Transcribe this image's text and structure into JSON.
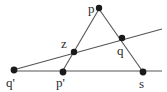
{
  "figure": {
    "width": 167,
    "height": 92,
    "background_color": "#ffffff",
    "stroke_color": "#555555",
    "point_color": "#1a1a1a",
    "label_color": "#2b2b2b"
  },
  "points": [
    {
      "id": "p",
      "label": "p",
      "x": 99,
      "y": 8,
      "label_x": 88,
      "label_y": 2,
      "radius": 3.2
    },
    {
      "id": "z",
      "label": "z",
      "x": 74,
      "y": 52,
      "label_x": 61,
      "label_y": 37,
      "radius": 3.2
    },
    {
      "id": "q",
      "label": "q",
      "x": 122,
      "y": 38,
      "label_x": 117,
      "label_y": 44,
      "radius": 3.2
    },
    {
      "id": "q-prime",
      "label": "q'",
      "x": 14,
      "y": 70,
      "label_x": 6,
      "label_y": 76,
      "radius": 3.4
    },
    {
      "id": "p-prime",
      "label": "p'",
      "x": 63,
      "y": 72,
      "label_x": 56,
      "label_y": 76,
      "radius": 3.4
    },
    {
      "id": "s",
      "label": "s",
      "x": 143,
      "y": 72,
      "label_x": 139,
      "label_y": 77,
      "radius": 3.4
    }
  ],
  "lines": [
    {
      "id": "line-horizontal-baseline",
      "from": "q-prime",
      "to": "s-extended",
      "x1": 13,
      "y1": 71,
      "x2": 162,
      "y2": 71,
      "width": 1.1
    },
    {
      "id": "line-transversal",
      "from": "q-prime",
      "to": "upper-right",
      "x1": 13,
      "y1": 70,
      "x2": 162,
      "y2": 29,
      "width": 1.1
    },
    {
      "id": "line-p-to-p-prime",
      "from": "p",
      "to": "p-prime",
      "x1": 99,
      "y1": 9,
      "x2": 62,
      "y2": 72,
      "width": 1.1
    },
    {
      "id": "line-p-to-s",
      "from": "p",
      "to": "s",
      "x1": 99,
      "y1": 9,
      "x2": 143,
      "y2": 72,
      "width": 1.1
    }
  ],
  "caption": ""
}
